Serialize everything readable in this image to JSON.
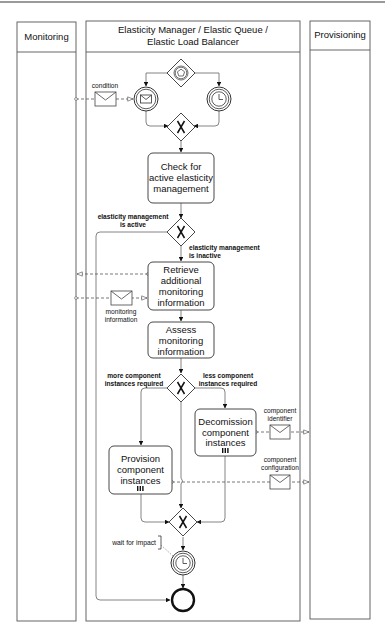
{
  "diagram": {
    "type": "BPMN collaboration",
    "lanes": [
      {
        "id": "monitoring",
        "title": "Monitoring"
      },
      {
        "id": "elastic",
        "title_line1": "Elasticity Manager / Elastic Queue /",
        "title_line2": "Elastic Load Balancer"
      },
      {
        "id": "provisioning",
        "title": "Provisioning"
      }
    ],
    "tasks": {
      "check": [
        "Check for",
        "active elasticity",
        "management"
      ],
      "retrieve": [
        "Retrieve",
        "additional",
        "monitoring",
        "information"
      ],
      "assess": [
        "Assess",
        "monitoring",
        "information"
      ],
      "decommission": [
        "Decomission",
        "component",
        "instances"
      ],
      "provision": [
        "Provision",
        "component",
        "instances"
      ]
    },
    "messages": {
      "condition": "condition",
      "monitoring_information": [
        "monitoring",
        "information"
      ],
      "component_identifier": [
        "component",
        "identifier"
      ],
      "component_configuration": [
        "component",
        "configuration"
      ]
    },
    "gateway_labels": {
      "active": [
        "elasticity management",
        "is active"
      ],
      "inactive": [
        "elasticity management",
        "is inactive"
      ],
      "more": [
        "more component",
        "instances required"
      ],
      "less": [
        "less component",
        "instances required"
      ]
    },
    "annotation": "wait for impact",
    "colors": {
      "stroke": "#333333",
      "flow": "#555555",
      "lane_border": "#555555",
      "background": "#ffffff"
    }
  }
}
